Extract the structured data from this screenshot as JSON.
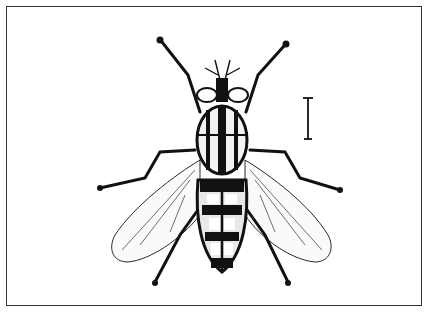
{
  "figure": {
    "scale_bar": {
      "present": true
    },
    "colors": {
      "ink": "#111111",
      "paper": "#ffffff",
      "frame": "#333333"
    }
  }
}
